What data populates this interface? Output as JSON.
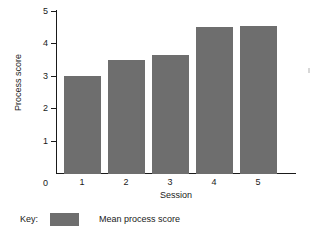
{
  "chart_data": {
    "type": "bar",
    "title": "",
    "categories": [
      "1",
      "2",
      "3",
      "4",
      "5"
    ],
    "values": [
      3.0,
      3.5,
      3.65,
      4.5,
      4.55
    ],
    "series": [
      {
        "name": "Mean process score",
        "values": [
          3.0,
          3.5,
          3.65,
          4.5,
          4.55
        ],
        "color": "#6e6e6e"
      }
    ],
    "xlabel": "Session",
    "ylabel": "Process score",
    "ylim": [
      0,
      5
    ],
    "yticks": [
      0,
      1,
      2,
      3,
      4,
      5
    ],
    "ytick_labels": [
      "0",
      "1",
      "2",
      "3",
      "4",
      "5"
    ],
    "xtick_labels": [
      "1",
      "2",
      "3",
      "4",
      "5"
    ],
    "grid": false,
    "legend_position": "below-plot"
  },
  "axes": {
    "y_title": "Process score",
    "x_title": "Session",
    "y_tick_labels": [
      "5",
      "4",
      "3",
      "2",
      "1",
      "0"
    ],
    "x_tick_labels": [
      "1",
      "2",
      "3",
      "4",
      "5"
    ]
  },
  "legend": {
    "title": "Key:",
    "entries": [
      {
        "label": "Mean process score",
        "color": "#6e6e6e"
      }
    ]
  },
  "colors": {
    "bar": "#6e6e6e",
    "axis": "#1a1a1a",
    "background": "#ffffff"
  }
}
